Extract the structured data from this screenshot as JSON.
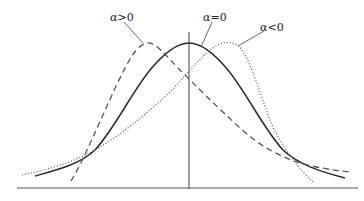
{
  "diagram": {
    "labels": [
      {
        "id": "pos",
        "text": "α>0",
        "greek": "α",
        "rel": ">0",
        "x": 110,
        "y": 12
      },
      {
        "id": "zero",
        "text": "α=0",
        "greek": "α",
        "rel": "=0",
        "x": 203,
        "y": 12
      },
      {
        "id": "neg",
        "text": "α<0",
        "greek": "α",
        "rel": "<0",
        "x": 260,
        "y": 22
      }
    ],
    "curves": [
      {
        "id": "alpha-zero",
        "label": "α=0",
        "style": "solid",
        "color": "#2a2a2a"
      },
      {
        "id": "alpha-positive",
        "label": "α>0",
        "style": "dashed",
        "color": "#555555"
      },
      {
        "id": "alpha-negative",
        "label": "α<0",
        "style": "dotted",
        "color": "#555555"
      }
    ],
    "axes": {
      "baseline_color": "#555555",
      "vertical_axis_color": "#444444"
    }
  }
}
